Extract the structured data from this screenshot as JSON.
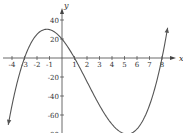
{
  "chart_data": {
    "type": "line",
    "title": "",
    "xlabel": "x",
    "ylabel": "y",
    "xlim": [
      -4.5,
      8.5
    ],
    "ylim": [
      -80,
      45
    ],
    "grid": false,
    "x_ticks": [
      -4,
      -3,
      -2,
      -1,
      1,
      2,
      3,
      4,
      5,
      6,
      7,
      8
    ],
    "y_ticks": [
      40,
      20,
      -20,
      -40,
      -60,
      -80
    ],
    "series": [
      {
        "name": "cubic f(x)",
        "function": "0.83*(x+3)*(x-1)*(x-8)",
        "x": [
          -4.3,
          -3,
          -2,
          -1,
          0,
          1,
          2,
          3,
          4,
          5,
          6,
          7,
          8,
          8.4
        ],
        "values": [
          -79,
          0,
          24.9,
          29.9,
          19.9,
          0,
          -24.9,
          -49.8,
          -69.7,
          -79.7,
          -74.7,
          -49.8,
          0,
          33
        ]
      }
    ],
    "annotations": [
      "arrowheads on both axes and at curve ends"
    ]
  },
  "labels": {
    "x_axis": "x",
    "y_axis": "y",
    "x_ticks": [
      "-4",
      "-3",
      "-2",
      "-1",
      "1",
      "2",
      "3",
      "4",
      "5",
      "6",
      "7",
      "8"
    ],
    "y_ticks": [
      "40",
      "20",
      "-20",
      "-40",
      "-60",
      "-80"
    ]
  }
}
